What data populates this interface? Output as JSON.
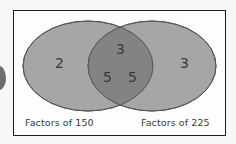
{
  "diagram": {
    "type": "venn",
    "sets": [
      {
        "label": "Factors of 150",
        "only_elements": [
          "2"
        ]
      },
      {
        "label": "Factors of 225",
        "only_elements": [
          "3"
        ]
      }
    ],
    "intersection": [
      "3",
      "5",
      "5"
    ],
    "colors": {
      "left_fill": "#a6a6a6",
      "right_fill": "#a6a6a6",
      "overlap_fill": "#838383",
      "stroke": "#555555",
      "frame": "#1c1c1c"
    }
  }
}
